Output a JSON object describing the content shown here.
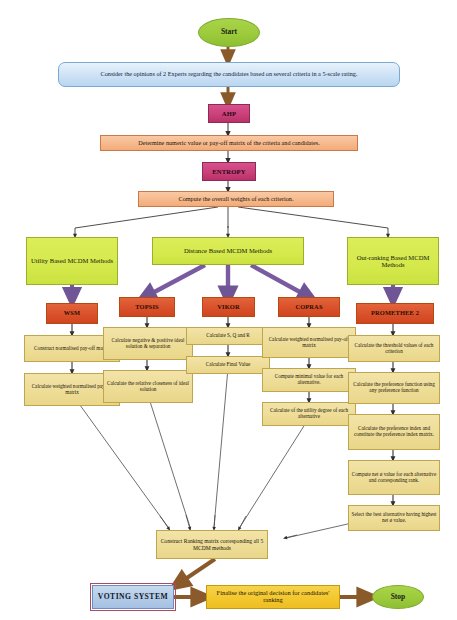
{
  "diagram": {
    "colors": {
      "terminator": "#9ccb3b",
      "input_box": "#cfe3f6",
      "weighting_method": "#c83f79",
      "process_peach": "#f6b98c",
      "category": "#d5e94c",
      "mcdm_method": "#d9512a",
      "step": "#eedd97",
      "final": "#f3c72e",
      "voting": "#b3cbe8",
      "arrow_brown": "#8a5a2b",
      "arrow_purple": "#7a5ba0",
      "connector_line": "#4a4a4a"
    },
    "nodes": {
      "start": "Start",
      "stop": "Stop",
      "consider_opinions": "Consider the opinions of 2 Experts regarding the candidates based on several criteria in a 5-scale rating.",
      "ahp": "AHP",
      "determine_payoff": "Determine numeric value or pay-off matrix of the criteria and candidates.",
      "entropy": "ENTROPY",
      "compute_weights": "Compute the overall weights of each criterion.",
      "utility_based": "Utility Based MCDM Methods",
      "distance_based": "Distance Based MCDM Methods",
      "outranking_based": "Out-ranking Based MCDM Methods",
      "wsm": "WSM",
      "topsis": "TOPSIS",
      "vikor": "VIKOR",
      "copras": "COPRAS",
      "promethee": "PROMETHEE 2",
      "wsm_step1": "Construct normalised pay-off matrix",
      "wsm_step2": "Calculate weighted normalised pay-off matrix",
      "topsis_step1": "Calculate negative & positive ideal solution & separation",
      "topsis_step2": "Calculate the relative closeness of ideal solution",
      "vikor_step1": "Calculate S, Q and R",
      "vikor_step2": "Calculate Final Value",
      "copras_step1": "Calculate weighted normalised pay-off matrix",
      "copras_step2": "Compute minimal value for each alternative.",
      "copras_step3": "Calculate of the utility degree of each alternative",
      "prom_step1": "Calculate the threshold values of each criterion",
      "prom_step2": "Calculate the preference function using any preference function",
      "prom_step3": "Calculate the preference index and constitute the preference index matrix.",
      "prom_step4": "Compute net ø value for each alternative and corresponding rank.",
      "prom_step5": "Select the best alternative having highest net ø value.",
      "ranking_matrix": "Construct Ranking matrix corresponding all 5 MCDM methods",
      "voting_system": "VOTING SYSTEM",
      "finalise": "Finalise the original decision for candidates' ranking"
    }
  }
}
